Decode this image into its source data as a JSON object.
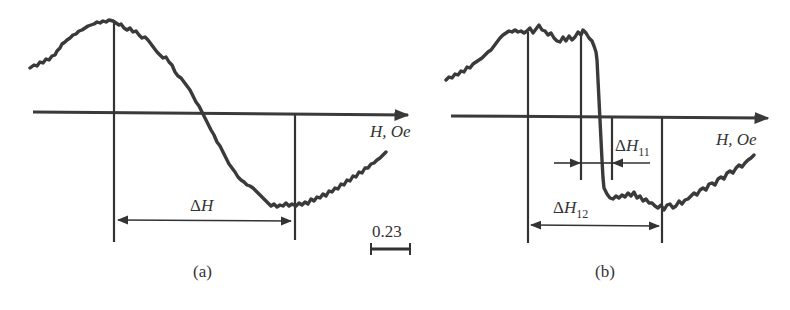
{
  "panels": [
    {
      "id": "a",
      "caption": "(a)",
      "axis_label": "H, Oe",
      "delta_label_prefix": "Δ",
      "delta_label_var": "H",
      "delta_label_sub": "",
      "scale_bar_value": "0.23"
    },
    {
      "id": "b",
      "caption": "(b)",
      "axis_label": "H, Oe",
      "delta11_prefix": "Δ",
      "delta11_var": "H",
      "delta11_sub": "11",
      "delta12_prefix": "Δ",
      "delta12_var": "H",
      "delta12_sub": "12"
    }
  ],
  "colors": {
    "ink": "#333333",
    "background": "#ffffff"
  }
}
